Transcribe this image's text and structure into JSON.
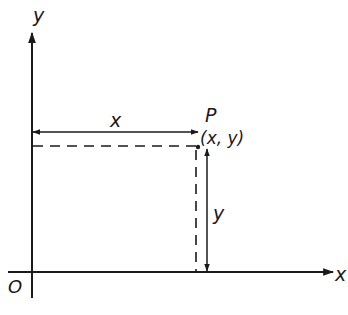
{
  "diagram": {
    "title": "",
    "type": "cartesian-coordinates-point",
    "colors": {
      "background": "#ffffff",
      "ink": "#1a1a1a"
    },
    "labels": {
      "y_axis": "y",
      "x_axis": "x",
      "origin": "O",
      "point_name": "P",
      "point_coords": "(x, y)",
      "horizontal_distance": "x",
      "vertical_distance": "y"
    },
    "elements": [
      {
        "id": "y-axis",
        "kind": "arrow",
        "from": [
          32,
          298
        ],
        "to": [
          32,
          32
        ]
      },
      {
        "id": "x-axis",
        "kind": "arrow",
        "from": [
          8,
          272
        ],
        "to": [
          334,
          272
        ]
      },
      {
        "id": "x-distance",
        "kind": "double-arrow",
        "from": [
          32,
          132
        ],
        "to": [
          198,
          132
        ],
        "label": "x"
      },
      {
        "id": "y-distance",
        "kind": "double-arrow",
        "from": [
          207,
          148
        ],
        "to": [
          207,
          272
        ],
        "label": "y"
      },
      {
        "id": "dashed-horizontal",
        "kind": "dashed-line",
        "from": [
          32,
          146
        ],
        "to": [
          198,
          146
        ]
      },
      {
        "id": "dashed-vertical",
        "kind": "dashed-line",
        "from": [
          196,
          148
        ],
        "to": [
          196,
          272
        ]
      },
      {
        "id": "point-P",
        "kind": "point",
        "at": [
          199,
          147
        ],
        "label": "P (x, y)"
      }
    ]
  }
}
